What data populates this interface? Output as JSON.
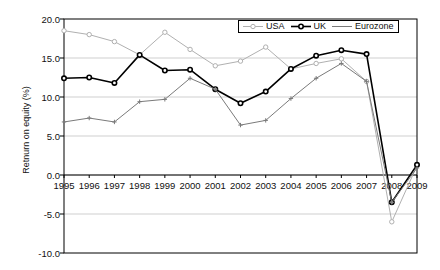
{
  "chart_data": {
    "type": "line",
    "title": "",
    "xlabel": "",
    "ylabel": "Retnurn on equity (%)",
    "categories": [
      "1995",
      "1996",
      "1997",
      "1998",
      "1999",
      "2000",
      "2001",
      "2002",
      "2003",
      "2004",
      "2005",
      "2006",
      "2007",
      "2008",
      "2009"
    ],
    "ylim": [
      -10.0,
      20.0
    ],
    "ytick_labels": [
      "20.0",
      "15.0",
      "10.0",
      "5.0",
      "0.0",
      "-5.0",
      "-10.0"
    ],
    "ytick_values": [
      20.0,
      15.0,
      10.0,
      5.0,
      0.0,
      -5.0,
      -10.0
    ],
    "grid": true,
    "grid_axis": "y",
    "legend_position": "top-right",
    "series": [
      {
        "name": "USA",
        "color": "#b0b0b0",
        "marker": "open-circle",
        "values": [
          18.5,
          18.0,
          17.1,
          15.4,
          18.3,
          16.1,
          14.0,
          14.6,
          16.4,
          13.6,
          14.3,
          14.9,
          12.0,
          -6.0,
          1.2
        ]
      },
      {
        "name": "UK",
        "color": "#000000",
        "marker": "open-circle",
        "values": [
          12.4,
          12.5,
          11.8,
          15.4,
          13.4,
          13.5,
          11.0,
          9.2,
          10.7,
          13.6,
          15.3,
          16.0,
          15.5,
          -3.5,
          1.3
        ]
      },
      {
        "name": "Eurozone",
        "color": "#7a7a7a",
        "marker": "plus",
        "values": [
          6.8,
          7.3,
          6.8,
          9.4,
          9.7,
          12.4,
          11.0,
          6.4,
          7.0,
          9.8,
          12.4,
          14.3,
          12.0,
          -3.5,
          0.9
        ]
      }
    ]
  },
  "legend": {
    "items": [
      {
        "label": "USA"
      },
      {
        "label": "UK"
      },
      {
        "label": "Eurozone"
      }
    ]
  },
  "colors": {
    "usa": "#b0b0b0",
    "uk": "#000000",
    "eurozone": "#7a7a7a",
    "axis": "#000000",
    "grid": "#cfcfcf",
    "background": "#ffffff"
  }
}
